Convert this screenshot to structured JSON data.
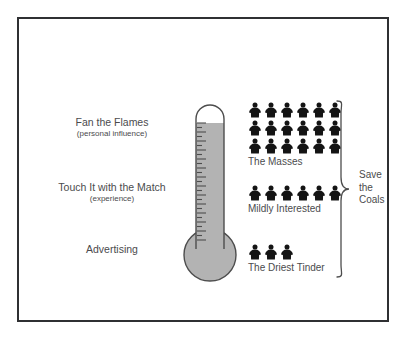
{
  "figure": {
    "frame_border_color": "#2f3032",
    "background_color": "#ffffff",
    "text_color": "#4b4b4d"
  },
  "thermometer": {
    "name": "engagement-thermometer",
    "fill_color": "#b3b3b3",
    "outline_color": "#4d4d4d",
    "fill_level_percent": 94,
    "tick_count": 30
  },
  "stages": [
    {
      "main": "Fan the Flames",
      "sub": "(personal influence)"
    },
    {
      "main": "Touch It with the Match",
      "sub": "(experience)"
    },
    {
      "main": "Advertising",
      "sub": ""
    }
  ],
  "audience_groups": [
    {
      "label": "The Masses",
      "rows": [
        6,
        6,
        6
      ],
      "count": 18,
      "icon": "person-icon"
    },
    {
      "label": "Mildly Interested",
      "rows": [
        6
      ],
      "count": 6,
      "icon": "person-icon"
    },
    {
      "label": "The Driest Tinder",
      "rows": [
        3
      ],
      "count": 3,
      "icon": "person-icon"
    }
  ],
  "brace": {
    "icon": "curly-brace-icon",
    "caption_lines": [
      "Save",
      "the",
      "Coals"
    ]
  },
  "chart_data": {
    "type": "pictogram",
    "title": "Save the Coals",
    "categories": [
      "The Masses",
      "Mildly Interested",
      "The Driest Tinder"
    ],
    "values": [
      18,
      6,
      3
    ],
    "unit": "person icon = 1 person",
    "axis_labels": [
      "Fan the Flames (personal influence)",
      "Touch It with the Match (experience)",
      "Advertising"
    ],
    "xlabel": "",
    "ylabel": "Engagement level",
    "legend": "",
    "grid": false
  }
}
